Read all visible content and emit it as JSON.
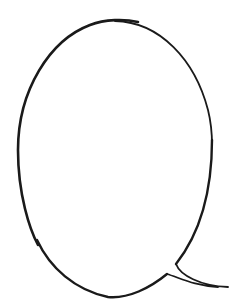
{
  "figure": {
    "type": "speech-bubble",
    "background": "#ffffff",
    "stroke_color": "#1a1a1a",
    "fill_color": "#ffffff"
  }
}
